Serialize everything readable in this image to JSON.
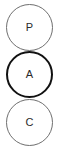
{
  "diagram": {
    "background_color": "#ffffff",
    "nodes": [
      {
        "id": "p",
        "label": "P",
        "shape": "circle",
        "emphasis": "normal",
        "stroke_color": "#6f6f6f",
        "stroke_width": "1px",
        "text_color": "#2b2b2b",
        "position": "top"
      },
      {
        "id": "a",
        "label": "A",
        "shape": "circle",
        "emphasis": "highlighted",
        "stroke_color": "#111111",
        "stroke_width": "2.2px",
        "text_color": "#2b2b2b",
        "position": "middle"
      },
      {
        "id": "c",
        "label": "C",
        "shape": "circle",
        "emphasis": "normal",
        "stroke_color": "#6f6f6f",
        "stroke_width": "1px",
        "text_color": "#2b2b2b",
        "position": "bottom"
      }
    ]
  }
}
